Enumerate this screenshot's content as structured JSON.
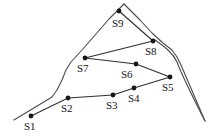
{
  "figure": {
    "background_color": "#ffffff",
    "terrain_line_color": "#4a4a50",
    "edge_color": "#2e2e34",
    "node_color": "#17171b",
    "label_color": "#141418",
    "width": 212,
    "height": 137
  },
  "nodes": [
    {
      "id": "S1",
      "label": "S1",
      "x": 31,
      "y": 116,
      "label_x": 24,
      "label_y": 121
    },
    {
      "id": "S2",
      "label": "S2",
      "x": 68,
      "y": 98,
      "label_x": 61,
      "label_y": 103
    },
    {
      "id": "S3",
      "label": "S3",
      "x": 113,
      "y": 95,
      "label_x": 106,
      "label_y": 100
    },
    {
      "id": "S4",
      "label": "S4",
      "x": 134,
      "y": 88,
      "label_x": 128,
      "label_y": 93
    },
    {
      "id": "S5",
      "label": "S5",
      "x": 170,
      "y": 77,
      "label_x": 162,
      "label_y": 82
    },
    {
      "id": "S6",
      "label": "S6",
      "x": 136,
      "y": 64,
      "label_x": 121,
      "label_y": 69
    },
    {
      "id": "S7",
      "label": "S7",
      "x": 85,
      "y": 58,
      "label_x": 77,
      "label_y": 63
    },
    {
      "id": "S8",
      "label": "S8",
      "x": 153,
      "y": 41,
      "label_x": 145,
      "label_y": 46
    },
    {
      "id": "S9",
      "label": "S9",
      "x": 119,
      "y": 11,
      "label_x": 112,
      "label_y": 18
    }
  ],
  "edges": [
    {
      "from": "S1",
      "to": "S2"
    },
    {
      "from": "S2",
      "to": "S3"
    },
    {
      "from": "S3",
      "to": "S4"
    },
    {
      "from": "S4",
      "to": "S5"
    },
    {
      "from": "S5",
      "to": "S6"
    },
    {
      "from": "S6",
      "to": "S7"
    },
    {
      "from": "S7",
      "to": "S8"
    },
    {
      "from": "S8",
      "to": "S9"
    }
  ],
  "terrain": {
    "left_ridge": "M 124 4 L 109 19 L 96 34 L 82 50 L 71 62 L 66 70 L 62 80 L 57 90 L 52 97 L 14 120",
    "right_ridge": "M 124 4 L 140 20 L 152 33 L 163 43 L 172 50 L 177 57 L 181 65 L 205 121",
    "right_ridge_inner": "M 155 40 C 165 47 173 53 177 62 C 180 70 185 82 205 121"
  }
}
